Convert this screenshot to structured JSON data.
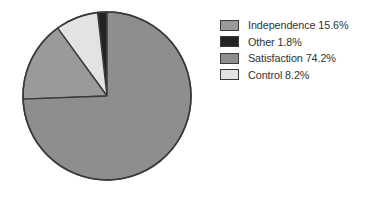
{
  "figure": {
    "background_color": "#ffffff",
    "outline_color": "#3b3b3b"
  },
  "legend": {
    "position": "right",
    "entries": [
      {
        "swatch_name": "legend-swatch-independence",
        "color": "#9a9a9a",
        "label": "Independence 15.6%"
      },
      {
        "swatch_name": "legend-swatch-other",
        "color": "#232323",
        "label": "Other 1.8%"
      },
      {
        "swatch_name": "legend-swatch-satisfaction",
        "color": "#8e8e8e",
        "label": "Satisfaction 74.2%"
      },
      {
        "swatch_name": "legend-swatch-control",
        "color": "#e3e3e3",
        "label": "Control 8.2%"
      }
    ]
  },
  "chart_data": {
    "type": "pie",
    "title": "",
    "subtitle": "",
    "xlabel": "",
    "ylabel": "",
    "legend_position": "right",
    "grid": false,
    "start_angle_deg": 90,
    "direction": "counterclockwise",
    "center": {
      "x": 107,
      "y": 96
    },
    "radius": 84,
    "categories": [
      "Independence",
      "Other",
      "Satisfaction",
      "Control"
    ],
    "values": [
      15.6,
      1.8,
      74.2,
      8.2
    ],
    "units": "percent",
    "slices": [
      {
        "name": "Other",
        "value": 1.8,
        "label": "Other 1.8%",
        "color": "#232323",
        "order_from_top_ccw": 1,
        "start_deg": 90.0,
        "end_deg": 96.48
      },
      {
        "name": "Control",
        "value": 8.2,
        "label": "Control 8.2%",
        "color": "#e3e3e3",
        "order_from_top_ccw": 2,
        "start_deg": 96.48,
        "end_deg": 126.0
      },
      {
        "name": "Independence",
        "value": 15.6,
        "label": "Independence 15.6%",
        "color": "#9a9a9a",
        "order_from_top_ccw": 3,
        "start_deg": 126.0,
        "end_deg": 182.16
      },
      {
        "name": "Satisfaction",
        "value": 74.2,
        "label": "Satisfaction 74.2%",
        "color": "#8e8e8e",
        "order_from_top_ccw": 4,
        "start_deg": 182.16,
        "end_deg": 450.0
      }
    ]
  }
}
